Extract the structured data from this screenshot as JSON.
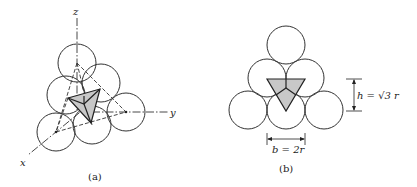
{
  "figure": {
    "panel_a": {
      "caption": "(a)",
      "axes": {
        "x_label": "x",
        "y_label": "y",
        "z_label": "z"
      }
    },
    "panel_b": {
      "caption": "(b)",
      "height_label": "h = √3 r",
      "base_label": "b = 2r"
    }
  },
  "colors": {
    "stroke": "#333333",
    "shade": "#c8c8c8",
    "background": "#ffffff"
  }
}
